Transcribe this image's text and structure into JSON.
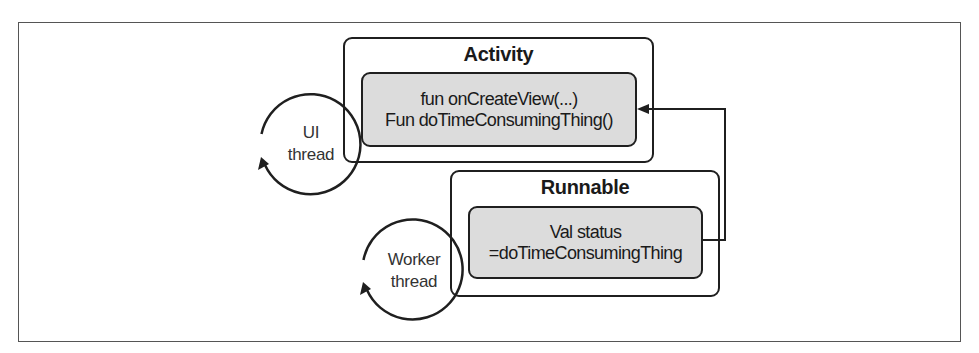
{
  "diagram": {
    "activity": {
      "title": "Activity",
      "lines": [
        "fun onCreateView(...)",
        "Fun doTimeConsumingThing()"
      ]
    },
    "runnable": {
      "title": "Runnable",
      "lines": [
        "Val status",
        "=doTimeConsumingThing"
      ]
    },
    "ui_thread": {
      "lines": [
        "UI",
        "thread"
      ]
    },
    "worker_thread": {
      "lines": [
        "Worker",
        "thread"
      ]
    },
    "connector": {
      "from": "runnable",
      "to": "activity",
      "label": ""
    },
    "colors": {
      "stroke": "#1f1f1f",
      "inner_fill": "#dcdcdc",
      "frame_border": "#555555",
      "background": "#ffffff"
    }
  }
}
